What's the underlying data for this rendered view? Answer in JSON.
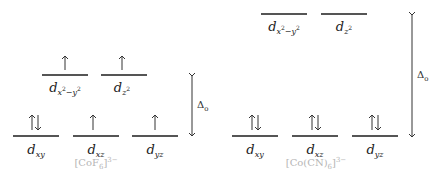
{
  "figure": {
    "type": "crystal-field-splitting-diagram",
    "line_color": "#555555",
    "label_color": "#222222",
    "complex_label_color": "#b5b5b5"
  },
  "diagrams": [
    {
      "name": "high-spin",
      "complex": {
        "base": "[CoF",
        "sub": "6",
        "close": "]",
        "charge": "3−"
      },
      "splitting_label": {
        "symbol": "Δ",
        "sub": "o"
      },
      "eg": [
        {
          "orbital": "d",
          "sub": "x",
          "sub_sup": "2",
          "sub_mid": "−y",
          "sub_sup2": "2",
          "electrons": "↑"
        },
        {
          "orbital": "d",
          "sub": "z",
          "sub_sup": "2",
          "sub_mid": "",
          "sub_sup2": "",
          "electrons": "↑"
        }
      ],
      "t2g": [
        {
          "orbital": "d",
          "sub": "xy",
          "electrons": "↑↓"
        },
        {
          "orbital": "d",
          "sub": "xz",
          "electrons": "↑"
        },
        {
          "orbital": "d",
          "sub": "yz",
          "electrons": "↑"
        }
      ]
    },
    {
      "name": "low-spin",
      "complex": {
        "base": "[Co(CN)",
        "sub": "6",
        "close": "]",
        "charge": "3−"
      },
      "splitting_label": {
        "symbol": "Δ",
        "sub": "o"
      },
      "eg": [
        {
          "orbital": "d",
          "sub": "x",
          "sub_sup": "2",
          "sub_mid": "−y",
          "sub_sup2": "2",
          "electrons": ""
        },
        {
          "orbital": "d",
          "sub": "z",
          "sub_sup": "2",
          "sub_mid": "",
          "sub_sup2": "",
          "electrons": ""
        }
      ],
      "t2g": [
        {
          "orbital": "d",
          "sub": "xy",
          "electrons": "↑↓"
        },
        {
          "orbital": "d",
          "sub": "xz",
          "electrons": "↑↓"
        },
        {
          "orbital": "d",
          "sub": "yz",
          "electrons": "↑↓"
        }
      ]
    }
  ]
}
